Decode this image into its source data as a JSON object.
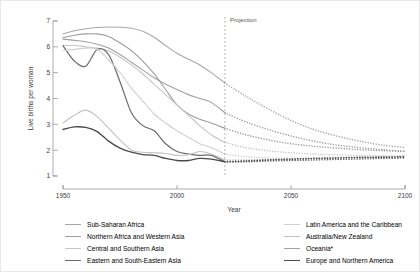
{
  "chart_data": {
    "type": "line",
    "title": "",
    "xlabel": "Year",
    "ylabel": "Live births per woman",
    "xlim": [
      1950,
      2100
    ],
    "ylim": [
      1,
      7
    ],
    "xticks": [
      1950,
      2000,
      2050,
      2100
    ],
    "yticks": [
      1,
      2,
      3,
      4,
      5,
      6,
      7
    ],
    "grid": false,
    "legend_position": "bottom",
    "annotations": [
      {
        "text": "Projection",
        "x": 2021,
        "y": 6.85,
        "type": "vline-label"
      }
    ],
    "projection_start_year": 2021,
    "series": [
      {
        "name": "Sub-Saharan Africa",
        "color": "#a8a8a8",
        "width": 1.1,
        "x": [
          1950,
          1955,
          1960,
          1965,
          1970,
          1975,
          1980,
          1985,
          1990,
          1995,
          2000,
          2005,
          2010,
          2015,
          2021,
          2030,
          2040,
          2050,
          2060,
          2070,
          2080,
          2090,
          2100
        ],
        "y": [
          6.5,
          6.62,
          6.7,
          6.75,
          6.77,
          6.76,
          6.72,
          6.6,
          6.37,
          6.05,
          5.75,
          5.52,
          5.3,
          5.0,
          4.6,
          4.1,
          3.6,
          3.15,
          2.8,
          2.55,
          2.35,
          2.2,
          2.1
        ]
      },
      {
        "name": "Northern Africa and Western Asia",
        "color": "#9e9e9e",
        "width": 1.1,
        "x": [
          1950,
          1955,
          1960,
          1965,
          1970,
          1975,
          1980,
          1985,
          1990,
          1995,
          2000,
          2005,
          2010,
          2015,
          2021,
          2030,
          2040,
          2050,
          2060,
          2070,
          2080,
          2090,
          2100
        ],
        "y": [
          6.35,
          6.45,
          6.5,
          6.5,
          6.4,
          6.15,
          5.85,
          5.45,
          4.95,
          4.35,
          3.75,
          3.4,
          3.2,
          3.05,
          2.85,
          2.6,
          2.4,
          2.25,
          2.15,
          2.08,
          2.02,
          1.98,
          1.95
        ]
      },
      {
        "name": "Central and Southern Asia",
        "color": "#c6c6c6",
        "width": 1.1,
        "x": [
          1950,
          1955,
          1960,
          1965,
          1970,
          1975,
          1980,
          1985,
          1990,
          1995,
          2000,
          2005,
          2010,
          2015,
          2021,
          2030,
          2040,
          2050,
          2060,
          2070,
          2080,
          2090,
          2100
        ],
        "y": [
          6.05,
          6.05,
          6.0,
          5.95,
          5.85,
          5.6,
          5.3,
          4.95,
          4.55,
          4.15,
          3.75,
          3.35,
          2.95,
          2.6,
          2.3,
          2.1,
          1.98,
          1.9,
          1.85,
          1.82,
          1.8,
          1.78,
          1.78
        ]
      },
      {
        "name": "Eastern and South-Eastern Asia",
        "color": "#6b6b6b",
        "width": 1.2,
        "x": [
          1950,
          1955,
          1960,
          1965,
          1970,
          1975,
          1980,
          1985,
          1990,
          1995,
          2000,
          2005,
          2010,
          2015,
          2021,
          2030,
          2040,
          2050,
          2060,
          2070,
          2080,
          2090,
          2100
        ],
        "y": [
          6.05,
          5.45,
          5.25,
          5.9,
          5.7,
          4.65,
          3.45,
          2.95,
          2.75,
          2.25,
          1.95,
          1.85,
          1.8,
          1.8,
          1.55,
          1.55,
          1.58,
          1.6,
          1.62,
          1.64,
          1.66,
          1.68,
          1.7
        ]
      },
      {
        "name": "Latin America and the Caribbean",
        "color": "#cfcfcf",
        "width": 1.1,
        "x": [
          1950,
          1955,
          1960,
          1965,
          1970,
          1975,
          1980,
          1985,
          1990,
          1995,
          2000,
          2005,
          2010,
          2015,
          2021,
          2030,
          2040,
          2050,
          2060,
          2070,
          2080,
          2090,
          2100
        ],
        "y": [
          5.85,
          5.9,
          5.95,
          5.9,
          5.5,
          5.0,
          4.4,
          3.9,
          3.4,
          3.05,
          2.75,
          2.5,
          2.25,
          2.1,
          1.85,
          1.75,
          1.7,
          1.68,
          1.67,
          1.68,
          1.7,
          1.72,
          1.74
        ]
      },
      {
        "name": "Australia/New Zealand",
        "color": "#c2c2c2",
        "width": 1.1,
        "x": [
          1950,
          1955,
          1960,
          1965,
          1970,
          1975,
          1980,
          1985,
          1990,
          1995,
          2000,
          2005,
          2010,
          2015,
          2021,
          2030,
          2040,
          2050,
          2060,
          2070,
          2080,
          2090,
          2100
        ],
        "y": [
          3.05,
          3.35,
          3.55,
          3.3,
          2.85,
          2.4,
          2.0,
          1.92,
          1.9,
          1.87,
          1.8,
          1.82,
          1.95,
          1.85,
          1.62,
          1.62,
          1.64,
          1.66,
          1.68,
          1.7,
          1.72,
          1.73,
          1.75
        ]
      },
      {
        "name": "Oceania*",
        "color": "#a0a0a0",
        "width": 1.1,
        "x": [
          1950,
          1955,
          1960,
          1965,
          1970,
          1975,
          1980,
          1985,
          1990,
          1995,
          2000,
          2005,
          2010,
          2015,
          2021,
          2030,
          2040,
          2050,
          2060,
          2070,
          2080,
          2090,
          2100
        ],
        "y": [
          6.3,
          6.25,
          6.2,
          6.1,
          5.95,
          5.7,
          5.4,
          5.1,
          4.8,
          4.55,
          4.35,
          4.15,
          4.0,
          3.85,
          3.45,
          3.1,
          2.8,
          2.55,
          2.35,
          2.2,
          2.1,
          2.02,
          1.96
        ]
      },
      {
        "name": "Europe and Northern America",
        "color": "#4a4a4a",
        "width": 1.3,
        "x": [
          1950,
          1955,
          1960,
          1965,
          1970,
          1975,
          1980,
          1985,
          1990,
          1995,
          2000,
          2005,
          2010,
          2015,
          2021,
          2030,
          2040,
          2050,
          2060,
          2070,
          2080,
          2090,
          2100
        ],
        "y": [
          2.8,
          2.9,
          2.88,
          2.72,
          2.35,
          2.08,
          1.92,
          1.83,
          1.8,
          1.68,
          1.6,
          1.6,
          1.68,
          1.65,
          1.55,
          1.58,
          1.62,
          1.65,
          1.68,
          1.7,
          1.72,
          1.73,
          1.74
        ]
      }
    ]
  },
  "axes": {
    "ylabel": "Live births per woman",
    "xlabel": "Year",
    "xticks": [
      "1950",
      "2000",
      "2050",
      "2100"
    ],
    "yticks": [
      "7",
      "6",
      "5",
      "4",
      "3",
      "2",
      "1"
    ]
  },
  "projection": {
    "label": "Projection"
  },
  "legend": {
    "left": [
      {
        "label": "Sub-Saharan Africa",
        "color": "#a8a8a8",
        "width": "1.1px"
      },
      {
        "label": "Northern Africa and Western Asia",
        "color": "#9e9e9e",
        "width": "1.2px"
      },
      {
        "label": "Central and Southern Asia",
        "color": "#c6c6c6",
        "width": "1.1px"
      },
      {
        "label": "Eastern and South-Eastern Asia",
        "color": "#6b6b6b",
        "width": "1.5px"
      }
    ],
    "right": [
      {
        "label": "Latin America and the Caribbean",
        "color": "#cfcfcf",
        "width": "1.1px"
      },
      {
        "label": "Australia/New Zealand",
        "color": "#c2c2c2",
        "width": "1.1px"
      },
      {
        "label": "Oceania*",
        "color": "#a0a0a0",
        "width": "1.2px"
      },
      {
        "label": "Europe and Northern America",
        "color": "#4a4a4a",
        "width": "1.8px"
      }
    ]
  }
}
